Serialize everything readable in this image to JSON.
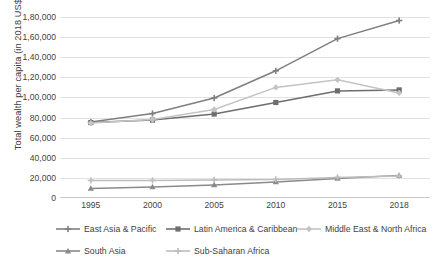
{
  "chart_data": {
    "type": "line",
    "title": "",
    "xlabel": "",
    "ylabel": "Total wealth per capita (in 2018 US$)",
    "categories": [
      "1995",
      "2000",
      "2005",
      "2010",
      "2015",
      "2018"
    ],
    "x_tick_labels": [
      "1995",
      "2000",
      "2005",
      "2010",
      "2015",
      "2018"
    ],
    "y_tick_labels": [
      "0",
      "20,000",
      "40,000",
      "60,000",
      "80,000",
      "1,00,000",
      "1,20,000",
      "1,40,000",
      "1,60,000",
      "1,80,000"
    ],
    "y_tick_values": [
      0,
      20000,
      40000,
      60000,
      80000,
      100000,
      120000,
      140000,
      160000,
      180000
    ],
    "ylim": [
      0,
      180000
    ],
    "grid": true,
    "legend_position": "bottom",
    "series": [
      {
        "name": "East Asia & Pacific",
        "color": "#7f7f7f",
        "marker": "plus",
        "values": [
          75500,
          84000,
          99500,
          126500,
          158500,
          176500
        ]
      },
      {
        "name": "Latin America & Caribbean",
        "color": "#6e6e6e",
        "marker": "square",
        "values": [
          75000,
          77500,
          83500,
          95000,
          106500,
          107500
        ]
      },
      {
        "name": "Middle East & North Africa",
        "color": "#c4c4c4",
        "marker": "diamond",
        "values": [
          74500,
          78000,
          88000,
          110000,
          117500,
          104500
        ]
      },
      {
        "name": "South Asia",
        "color": "#8a8a8a",
        "marker": "triangle",
        "values": [
          9500,
          11000,
          13000,
          16000,
          19500,
          22500
        ]
      },
      {
        "name": "Sub-Saharan Africa",
        "color": "#bdbdbd",
        "marker": "plus",
        "values": [
          17500,
          17500,
          18000,
          18500,
          20500,
          22000
        ]
      }
    ]
  },
  "legend": {
    "rows": [
      [
        {
          "label": "East Asia & Pacific",
          "series_index": 0,
          "left": 55
        },
        {
          "label": "Latin America & Caribbean",
          "series_index": 1,
          "left": 165
        },
        {
          "label": "Middle East & North Africa",
          "series_index": 2,
          "left": 296
        }
      ],
      [
        {
          "label": "South Asia",
          "series_index": 3,
          "left": 55
        },
        {
          "label": "Sub-Saharan Africa",
          "series_index": 4,
          "left": 165
        }
      ]
    ]
  },
  "colors": {
    "background": "#ffffff",
    "gridline": "#e2e2e2",
    "text": "#3f3f3f",
    "axis": "#c9c9c9"
  }
}
